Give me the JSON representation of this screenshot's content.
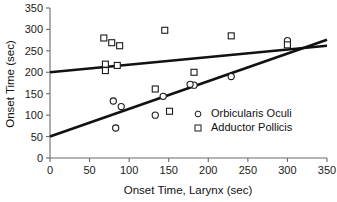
{
  "chart_data": {
    "type": "scatter",
    "title": "",
    "xlabel": "Onset Time, Larynx (sec)",
    "ylabel": "Onset Time (sec)",
    "xlim": [
      0,
      350
    ],
    "ylim": [
      0,
      350
    ],
    "xticks": [
      0,
      50,
      100,
      150,
      200,
      250,
      300,
      350
    ],
    "yticks": [
      0,
      50,
      100,
      150,
      200,
      250,
      300,
      350
    ],
    "xtick_labels": [
      "0",
      "50",
      "100",
      "150",
      "200",
      "250",
      "300",
      "350"
    ],
    "ytick_labels": [
      "0",
      "50",
      "100",
      "150",
      "200",
      "250",
      "300",
      "350"
    ],
    "grid": false,
    "legend_position": "lower-right",
    "series": [
      {
        "name": "Orbicularis Oculi",
        "marker": "circle",
        "points": [
          [
            80,
            133
          ],
          [
            90,
            120
          ],
          [
            83,
            70
          ],
          [
            133,
            100
          ],
          [
            143,
            144
          ],
          [
            182,
            170
          ],
          [
            177,
            172
          ],
          [
            229,
            190
          ],
          [
            300,
            274
          ]
        ]
      },
      {
        "name": "Adductor Pollicis",
        "marker": "square",
        "points": [
          [
            68,
            280
          ],
          [
            78,
            269
          ],
          [
            88,
            262
          ],
          [
            70,
            219
          ],
          [
            70,
            204
          ],
          [
            85,
            216
          ],
          [
            145,
            298
          ],
          [
            133,
            161
          ],
          [
            151,
            109
          ],
          [
            182,
            200
          ],
          [
            229,
            285
          ],
          [
            300,
            264
          ]
        ]
      }
    ],
    "fit_lines": [
      {
        "name": "Adductor Pollicis fit",
        "x0": 0,
        "y0": 200,
        "x1": 350,
        "y1": 262
      },
      {
        "name": "Orbicularis Oculi fit",
        "x0": 0,
        "y0": 50,
        "x1": 350,
        "y1": 276
      }
    ]
  },
  "legend": {
    "entries": [
      {
        "label": "Orbicularis Oculi",
        "marker": "circle-marker-icon"
      },
      {
        "label": "Adductor Pollicis",
        "marker": "square-marker-icon"
      }
    ]
  },
  "colors": {
    "line": "#111111",
    "marker_stroke": "#1a1a1a",
    "marker_fill": "#ffffff",
    "axis": "#6b6b6b",
    "text": "#111111",
    "background": "#ffffff"
  }
}
